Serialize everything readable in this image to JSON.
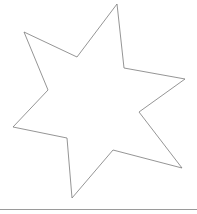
{
  "shape": {
    "type": "six-pointed-star",
    "stroke_color": "#7a7a7a",
    "fill_color": "#ffffff",
    "stroke_width": 0.8,
    "points": [
      [
        117,
        4
      ],
      [
        124,
        68
      ],
      [
        185,
        79
      ],
      [
        139,
        112
      ],
      [
        182,
        168
      ],
      [
        113,
        150
      ],
      [
        72,
        198
      ],
      [
        67,
        138
      ],
      [
        13,
        127
      ],
      [
        48,
        90
      ],
      [
        24,
        32
      ],
      [
        77,
        57
      ]
    ]
  },
  "baseline": {
    "color": "#9a9a9a",
    "y": 209
  }
}
